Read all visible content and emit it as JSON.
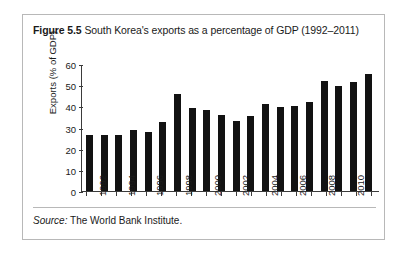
{
  "figure": {
    "label": "Figure 5.5",
    "caption": "South Korea's exports as a percentage of GDP (1992–2011)",
    "source_label": "Source:",
    "source_text": "The World Bank Institute."
  },
  "chart_data": {
    "type": "bar",
    "title": "South Korea's exports as a percentage of GDP (1992–2011)",
    "xlabel": "",
    "ylabel": "Exports (% of GDP)",
    "ylim": [
      0,
      60
    ],
    "yticks": [
      0,
      10,
      20,
      30,
      40,
      50,
      60
    ],
    "grid": false,
    "legend": false,
    "bar_color": "#121212",
    "categories": [
      "1992",
      "1993",
      "1994",
      "1995",
      "1996",
      "1997",
      "1998",
      "1999",
      "2000",
      "2001",
      "2002",
      "2003",
      "2004",
      "2005",
      "2006",
      "2007",
      "2008",
      "2009",
      "2010",
      "2011"
    ],
    "tick_labels_shown": [
      "1992",
      "1994",
      "1996",
      "1998",
      "2000",
      "2002",
      "2004",
      "2006",
      "2008",
      "2010"
    ],
    "values": [
      26.5,
      26.5,
      26.5,
      29.0,
      28.0,
      32.5,
      46.0,
      39.0,
      38.5,
      36.0,
      33.0,
      35.5,
      41.0,
      39.5,
      40.0,
      42.0,
      52.0,
      49.5,
      51.5,
      55.5
    ]
  }
}
